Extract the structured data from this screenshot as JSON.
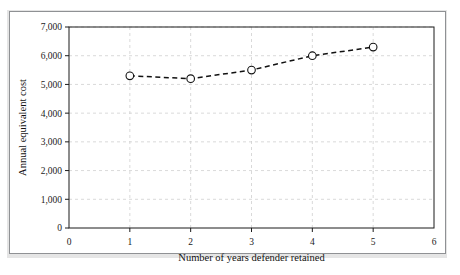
{
  "figure": {
    "background_color": "#ffffff",
    "frame_color": "#8f9194",
    "plot_frame_color": "#1b1b1b",
    "grid_color": "#c8c8c8"
  },
  "chart_data": {
    "type": "line",
    "title": "",
    "subtitle": "",
    "xlabel": "Number of years defender retained",
    "ylabel": "Annual equivalent cost",
    "x": [
      1,
      2,
      3,
      4,
      5
    ],
    "values": [
      5300,
      5200,
      5500,
      6000,
      6300
    ],
    "series": [
      {
        "name": "Annual equivalent cost",
        "x": [
          1,
          2,
          3,
          4,
          5
        ],
        "values": [
          5300,
          5200,
          5500,
          6000,
          6300
        ]
      }
    ],
    "xlim": [
      0,
      6
    ],
    "ylim": [
      0,
      7000
    ],
    "xticks": [
      0,
      1,
      2,
      3,
      4,
      5,
      6
    ],
    "yticks": [
      0,
      1000,
      2000,
      3000,
      4000,
      5000,
      6000,
      7000
    ],
    "xtick_labels": [
      "0",
      "1",
      "2",
      "3",
      "4",
      "5",
      "6"
    ],
    "ytick_labels": [
      "0",
      "1,000",
      "2,000",
      "3,000",
      "4,000",
      "5,000",
      "6,000",
      "7,000"
    ],
    "grid": true,
    "grid_style": "dashed",
    "line_style": "dashed",
    "line_color": "#111111",
    "marker": "open-circle",
    "marker_face_color": "#ffffff",
    "marker_edge_color": "#111111",
    "legend": null,
    "legend_position": "none",
    "annotations": []
  }
}
